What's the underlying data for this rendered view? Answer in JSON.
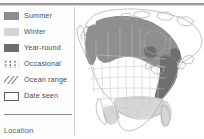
{
  "panel": {
    "title_rule": "top-divider",
    "footer_label": "Location"
  },
  "legend": {
    "items": [
      {
        "label": "Summer",
        "swatch": "solid-fill-swatch",
        "color": "#8d8d8d"
      },
      {
        "label": "Winter",
        "swatch": "solid-fill-swatch",
        "color": "#d5d5d5"
      },
      {
        "label": "Year-round",
        "swatch": "solid-fill-swatch",
        "color": "#6e6e6e"
      },
      {
        "label": "Occasional",
        "swatch": "dotted-fill-swatch",
        "color": "#7a7a7a"
      },
      {
        "label": "Ocean range",
        "swatch": "hatched-fill-swatch",
        "color": "#7d7d7d"
      },
      {
        "label": "Date seen",
        "swatch": "outline-box-swatch",
        "color": "#5c5c5c"
      }
    ]
  },
  "map": {
    "name": "north-america-range-map",
    "region": "North America",
    "colors": {
      "summer": "#8d8d8d",
      "winter": "#d5d5d5",
      "year_round": "#6e6e6e",
      "outline": "#b3b3b3",
      "coast": "#9a9a9a",
      "water": "#ffffff",
      "land": "#ffffff"
    }
  }
}
